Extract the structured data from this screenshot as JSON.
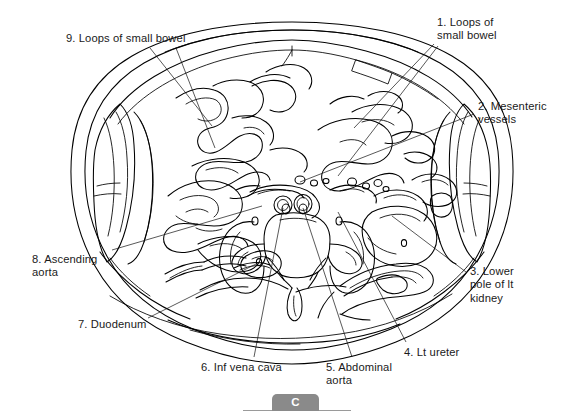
{
  "figure": {
    "type": "anatomical-line-drawing",
    "panel_letter": "C",
    "background_color": "#ffffff",
    "line_color": "#000000",
    "badge_color": "#8a8a8a",
    "badge_text_color": "#ffffff"
  },
  "labels": [
    {
      "number": "1",
      "text": "1. Loops of\nsmall bowel",
      "x": 437,
      "y": 16
    },
    {
      "number": "2",
      "text": "2. Mesenteric\nvessels",
      "x": 478,
      "y": 100
    },
    {
      "number": "3",
      "text": "3. Lower\npole of lt\nkidney",
      "x": 470,
      "y": 265
    },
    {
      "number": "4",
      "text": "4. Lt ureter",
      "x": 404,
      "y": 346
    },
    {
      "number": "5",
      "text": "5. Abdominal\naorta",
      "x": 326,
      "y": 361
    },
    {
      "number": "6",
      "text": "6. Inf vena cava",
      "x": 201,
      "y": 361
    },
    {
      "number": "7",
      "text": "7. Duodenum",
      "x": 78,
      "y": 318
    },
    {
      "number": "8",
      "text": "8. Ascending\naorta",
      "x": 32,
      "y": 253
    },
    {
      "number": "9",
      "text": "9. Loops of small bowel",
      "x": 66,
      "y": 32
    }
  ]
}
